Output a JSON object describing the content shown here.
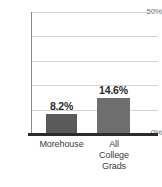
{
  "chart_data": {
    "type": "bar",
    "title": "",
    "subtitle": "",
    "xlabel": "",
    "ylabel": "",
    "categories": [
      "Morehouse",
      "All College Grads"
    ],
    "category_lines": [
      [
        "Morehouse"
      ],
      [
        "All",
        "College",
        "Grads"
      ]
    ],
    "values": [
      8.2,
      14.6
    ],
    "value_labels": [
      "8.2%",
      "14.6%"
    ],
    "ylim": [
      0,
      50
    ],
    "y_ticks": [
      0,
      50
    ],
    "y_tick_labels": [
      "0%",
      "50%"
    ],
    "gridlines": [
      10,
      20,
      30,
      40,
      50
    ],
    "grid": true,
    "legend": false,
    "legend_position": "none",
    "bar_colors": [
      "#5a5a5a",
      "#6e6e6e"
    ],
    "axis_color": "#2b2b2b",
    "grid_color": "#d3d3d3",
    "tick_label_color": "#6d6d6d",
    "value_label_color": "#2b2b2b",
    "background": "#ffffff"
  },
  "axis": {
    "y_top_label": "50%",
    "y_bottom_label": "0%"
  }
}
